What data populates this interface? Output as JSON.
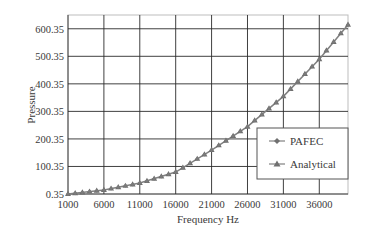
{
  "chart_data": {
    "type": "line",
    "title": "",
    "xlabel": "Frequency Hz",
    "ylabel": "Pressure",
    "xlim": [
      1000,
      40000
    ],
    "ylim": [
      0.35,
      650.35
    ],
    "x_ticks": [
      "1000",
      "6000",
      "11000",
      "16000",
      "21000",
      "26000",
      "31000",
      "36000"
    ],
    "y_ticks": [
      "0.35",
      "100.35",
      "200.35",
      "300.35",
      "400.35",
      "500.35",
      "600.35"
    ],
    "grid": true,
    "legend_position": "lower right (inside plot)",
    "values_are_approximate": true,
    "x": [
      1000,
      6000,
      11000,
      16000,
      21000,
      26000,
      31000,
      36000,
      40000
    ],
    "series": [
      {
        "name": "PAFEC",
        "marker": "diamond",
        "values": [
          0.35,
          15,
          40,
          80,
          160,
          245,
          355,
          490,
          615
        ]
      },
      {
        "name": "Analytical",
        "marker": "triangle",
        "values": [
          0.35,
          15,
          40,
          80,
          160,
          245,
          355,
          490,
          615
        ]
      }
    ]
  },
  "legend": {
    "items": [
      {
        "label": "PAFEC",
        "marker": "diamond"
      },
      {
        "label": "Analytical",
        "marker": "triangle"
      }
    ]
  },
  "colors": {
    "series": "#808080",
    "grid": "#2b2b2b",
    "frame": "#bdbdbd"
  }
}
